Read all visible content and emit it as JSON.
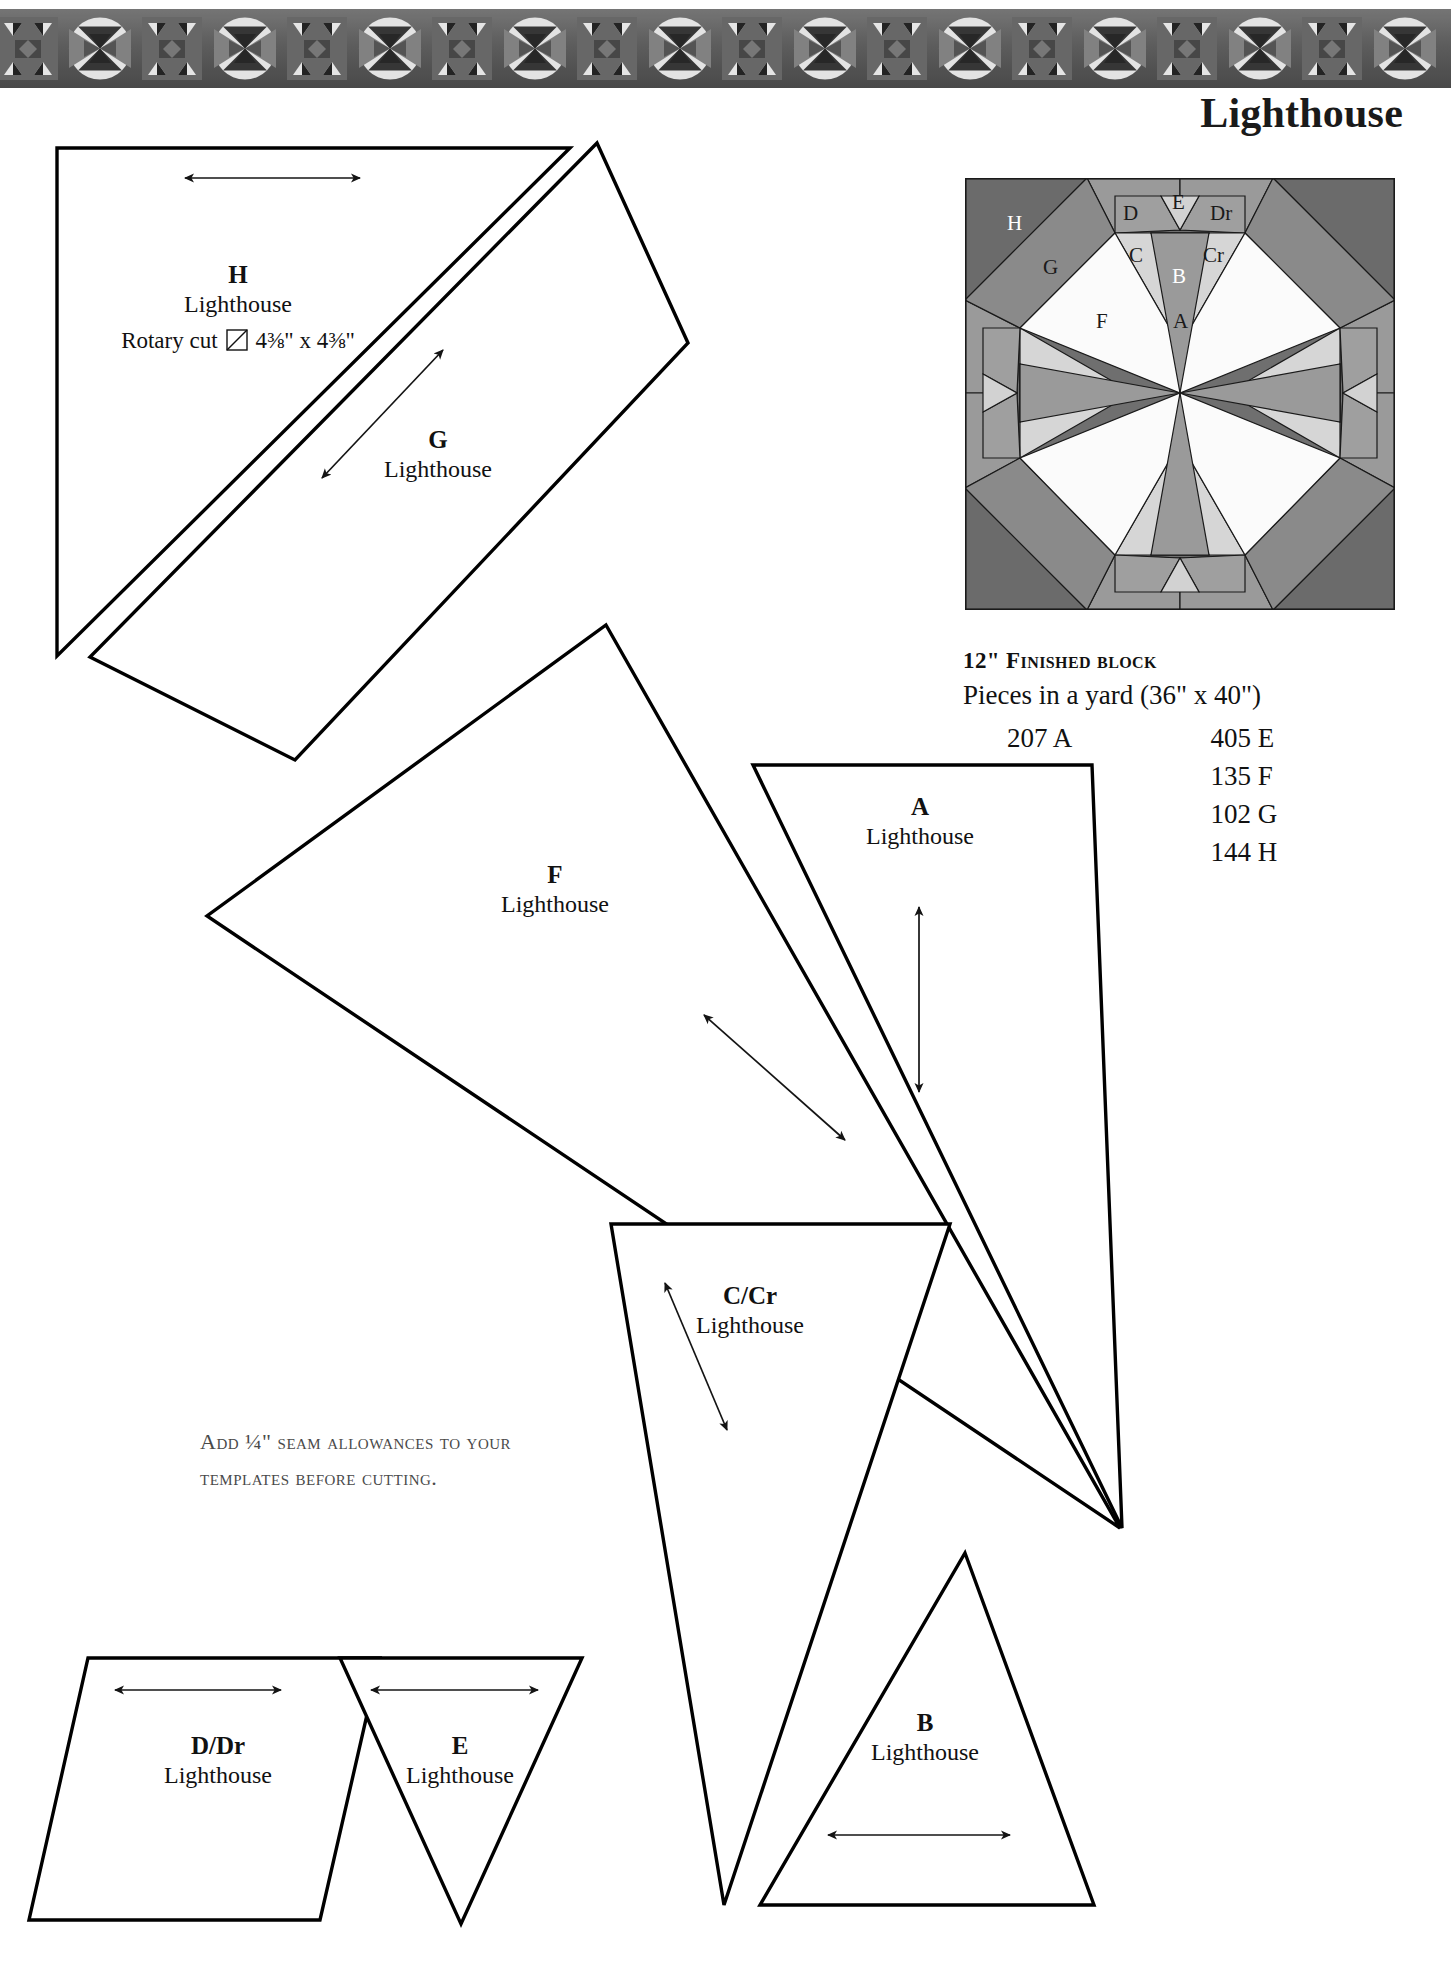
{
  "page": {
    "title": "Lighthouse",
    "border_motif": "pieced-quilt-photo-border"
  },
  "block_diagram": {
    "caption_letters": [
      "H",
      "G",
      "D",
      "E",
      "Dr",
      "C",
      "B",
      "Cr",
      "F",
      "A"
    ],
    "labels": {
      "h": "H",
      "g": "G",
      "d": "D",
      "e": "E",
      "dr": "Dr",
      "c": "C",
      "b": "B",
      "cr": "Cr",
      "f": "F",
      "a": "A"
    },
    "colors": {
      "dark_corner": "#6b6b6b",
      "mid_gray": "#8f8f8f",
      "light_gray": "#bdbdbd",
      "pale_gray": "#d6d6d6",
      "white": "#fbfbfb",
      "very_dark": "#4a4a4a",
      "outline": "#1a1a1a"
    }
  },
  "info": {
    "finished_block": "12\" Finished block",
    "pieces_heading": "Pieces in a yard (36\" x 40\")",
    "pieces": [
      {
        "left": "207 A",
        "right": "405 E"
      },
      {
        "left": "273 B",
        "right": "135 F"
      },
      {
        "left": "275 C",
        "right": "102 G"
      },
      {
        "left": "238 D",
        "right": "144 H"
      }
    ]
  },
  "templates": [
    {
      "id": "h",
      "letter": "H",
      "name": "Lighthouse",
      "rotary_prefix": "Rotary cut",
      "rotary_size": "4⅜\" x 4⅜\"",
      "rotary_icon": "square-diagonal-icon"
    },
    {
      "id": "g",
      "letter": "G",
      "name": "Lighthouse"
    },
    {
      "id": "f",
      "letter": "F",
      "name": "Lighthouse"
    },
    {
      "id": "a",
      "letter": "A",
      "name": "Lighthouse"
    },
    {
      "id": "ccr",
      "letter": "C/Cr",
      "name": "Lighthouse"
    },
    {
      "id": "b",
      "letter": "B",
      "name": "Lighthouse"
    },
    {
      "id": "ddr",
      "letter": "D/Dr",
      "name": "Lighthouse"
    },
    {
      "id": "e",
      "letter": "E",
      "name": "Lighthouse"
    }
  ],
  "seam_note": {
    "line1": "Add ¼\" seam allowances to your",
    "line2": "templates before cutting."
  }
}
